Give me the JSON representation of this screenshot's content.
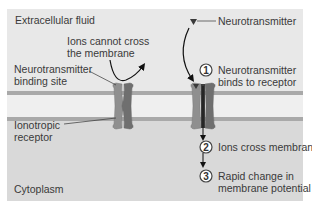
{
  "regions": {
    "extracellular": "Extracellular fluid",
    "cytoplasm": "Cytoplasm"
  },
  "labels": {
    "ions_cannot_cross": [
      "Ions cannot cross",
      "the membrane"
    ],
    "binding_site": [
      "Neurotransmitter",
      "binding site"
    ],
    "ionotropic_receptor": [
      "Ionotropic",
      "receptor"
    ],
    "neurotransmitter": "Neurotransmitter"
  },
  "steps": [
    {
      "number": "1",
      "text": [
        "Neurotransmitter",
        "binds to receptor"
      ]
    },
    {
      "number": "2",
      "text": [
        "Ions cross membrane"
      ]
    },
    {
      "number": "3",
      "text": [
        "Rapid change in",
        "membrane potential"
      ]
    }
  ],
  "colors": {
    "extracellular_bg": "#e8e8e8",
    "cytoplasm_bg": "#d9d9d9",
    "membrane_interior": "#efefef",
    "membrane_edge": "#a9a9a9",
    "receptor_left": "#8a8a8a",
    "receptor_right": "#6e6e6e",
    "text": "#3a3a3a"
  }
}
